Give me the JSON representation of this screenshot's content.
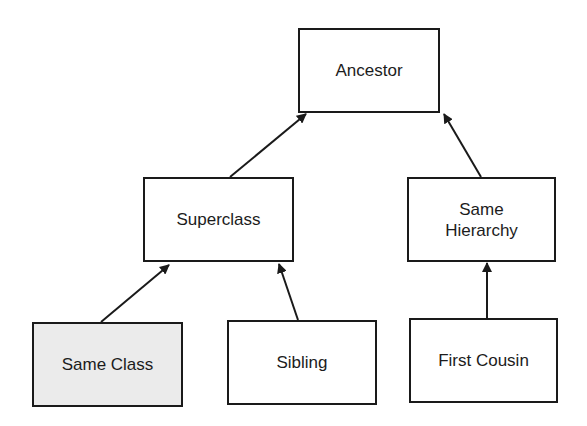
{
  "diagram": {
    "colors": {
      "stroke": "#1a1a1a",
      "text": "#1c1c1c",
      "node_fill": "#ffffff",
      "highlight_fill": "#ebebeb",
      "background": "#ffffff"
    },
    "nodes": [
      {
        "id": "ancestor",
        "label": "Ancestor",
        "x": 298,
        "y": 28,
        "w": 142,
        "h": 85,
        "highlight": false
      },
      {
        "id": "superclass",
        "label": "Superclass",
        "x": 143,
        "y": 177,
        "w": 151,
        "h": 85,
        "highlight": false
      },
      {
        "id": "same-hierarchy",
        "label": "Same\nHierarchy",
        "x": 407,
        "y": 177,
        "w": 149,
        "h": 85,
        "highlight": false
      },
      {
        "id": "same-class",
        "label": "Same Class",
        "x": 32,
        "y": 322,
        "w": 151,
        "h": 85,
        "highlight": true
      },
      {
        "id": "sibling",
        "label": "Sibling",
        "x": 227,
        "y": 320,
        "w": 150,
        "h": 85,
        "highlight": false
      },
      {
        "id": "first-cousin",
        "label": "First Cousin",
        "x": 409,
        "y": 318,
        "w": 149,
        "h": 85,
        "highlight": false
      }
    ],
    "edges": [
      {
        "from": "superclass",
        "to": "ancestor",
        "x1": 230,
        "y1": 177,
        "x2": 306,
        "y2": 114
      },
      {
        "from": "same-hierarchy",
        "to": "ancestor",
        "x1": 481,
        "y1": 177,
        "x2": 444,
        "y2": 114
      },
      {
        "from": "same-class",
        "to": "superclass",
        "x1": 101,
        "y1": 322,
        "x2": 169,
        "y2": 265
      },
      {
        "from": "sibling",
        "to": "superclass",
        "x1": 298,
        "y1": 320,
        "x2": 279,
        "y2": 264
      },
      {
        "from": "first-cousin",
        "to": "same-hierarchy",
        "x1": 487,
        "y1": 318,
        "x2": 487,
        "y2": 263
      }
    ]
  }
}
